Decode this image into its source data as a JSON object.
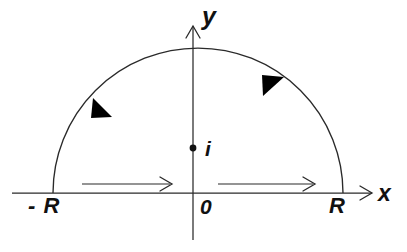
{
  "figure": {
    "type": "contour-integration-diagram",
    "stroke_color": "#2a2a2a",
    "label_color": "#111111",
    "background": "#ffffff"
  },
  "axes": {
    "x_axis": {
      "label": "x",
      "origin_label": "0",
      "y_position": 193,
      "x_start": 12,
      "x_end": 372,
      "arrow": "right"
    },
    "y_axis": {
      "label": "y",
      "x_position": 193,
      "y_top": 26,
      "y_bottom": 240,
      "arrow": "up"
    }
  },
  "markers": {
    "left_endpoint": {
      "label": "- R",
      "x": 53,
      "y": 193
    },
    "right_endpoint": {
      "label": "R",
      "x": 343,
      "y": 193
    },
    "pole": {
      "label": "i",
      "x": 193,
      "y": 148,
      "dot_radius": 3.4
    }
  },
  "contour": {
    "radius": 145,
    "center_x": 193,
    "center_y": 193,
    "apex_y": 48,
    "arc_direction": "counterclockwise",
    "segments": [
      {
        "name": "left-real-segment",
        "direction": "right",
        "x_start": 82,
        "x_end": 172,
        "y": 184
      },
      {
        "name": "right-real-segment",
        "direction": "right",
        "x_start": 218,
        "x_end": 315,
        "y": 184
      },
      {
        "name": "upper-arc",
        "direction": "counterclockwise"
      }
    ],
    "arc_arrows": [
      {
        "name": "arc-arrow-left",
        "tip_x": 92,
        "tip_y": 117,
        "points": "down-left"
      },
      {
        "name": "arc-arrow-right",
        "tip_x": 262,
        "tip_y": 75,
        "points": "up-left"
      }
    ]
  }
}
